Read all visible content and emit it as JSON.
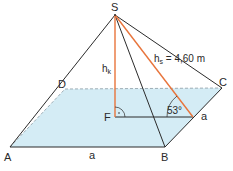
{
  "diagram": {
    "type": "square-pyramid",
    "vertices": {
      "S": "S",
      "A": "A",
      "B": "B",
      "C": "C",
      "D": "D",
      "F": "F"
    },
    "labels": {
      "apex": "S",
      "corner_a": "A",
      "corner_b": "B",
      "corner_c": "C",
      "corner_d": "D",
      "foot": "F",
      "side_ab": "a",
      "side_bc": "a",
      "height_main": "h",
      "height_sub": "k",
      "slant_main": "h",
      "slant_sub": "s",
      "slant_value": " = 4,60 m",
      "angle": "53°"
    },
    "colors": {
      "edge": "#2b2b2b",
      "height": "#e8743b",
      "base_fill": "#d4ecf5",
      "dashed": "#8a9aa3"
    }
  }
}
